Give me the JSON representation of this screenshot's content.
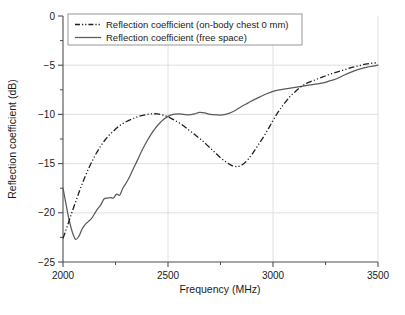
{
  "chart_data": {
    "type": "line",
    "title": "",
    "xlabel": "Frequency (MHz)",
    "ylabel": "Reflection coefficient (dB)",
    "xlim": [
      2000,
      3500
    ],
    "ylim": [
      -25,
      0
    ],
    "xticks": [
      2000,
      2500,
      3000,
      3500
    ],
    "xtick_labels": [
      "2000",
      "2500",
      "3000",
      "3500"
    ],
    "yticks": [
      0,
      -5,
      -10,
      -15,
      -20,
      -25
    ],
    "ytick_labels": [
      "0",
      "−5",
      "−10",
      "−15",
      "−20",
      "−25"
    ],
    "y_minor_ticks": [
      -2.5,
      -7.5,
      -12.5,
      -17.5,
      -22.5
    ],
    "x_minor_ticks": [
      2250,
      2750,
      3250
    ],
    "grid": true,
    "grid_axes": "both",
    "legend_position": "top-left-inside",
    "series": [
      {
        "name": "Reflection coefficient (on-body chest 0 mm)",
        "style": "dash-dot",
        "color": "#1f1f1f",
        "points": [
          [
            2000,
            -22.6
          ],
          [
            2020,
            -21.4
          ],
          [
            2040,
            -20.1
          ],
          [
            2060,
            -18.9
          ],
          [
            2080,
            -17.7
          ],
          [
            2100,
            -16.6
          ],
          [
            2120,
            -15.6
          ],
          [
            2140,
            -14.7
          ],
          [
            2160,
            -13.9
          ],
          [
            2180,
            -13.2
          ],
          [
            2200,
            -12.6
          ],
          [
            2220,
            -12.1
          ],
          [
            2240,
            -11.7
          ],
          [
            2260,
            -11.3
          ],
          [
            2280,
            -11.0
          ],
          [
            2300,
            -10.75
          ],
          [
            2330,
            -10.45
          ],
          [
            2360,
            -10.2
          ],
          [
            2390,
            -10.05
          ],
          [
            2420,
            -9.95
          ],
          [
            2450,
            -9.95
          ],
          [
            2480,
            -10.1
          ],
          [
            2510,
            -10.35
          ],
          [
            2540,
            -10.7
          ],
          [
            2570,
            -11.1
          ],
          [
            2600,
            -11.6
          ],
          [
            2630,
            -12.1
          ],
          [
            2660,
            -12.6
          ],
          [
            2690,
            -13.2
          ],
          [
            2720,
            -13.8
          ],
          [
            2750,
            -14.4
          ],
          [
            2780,
            -14.9
          ],
          [
            2805,
            -15.2
          ],
          [
            2830,
            -15.3
          ],
          [
            2855,
            -15.1
          ],
          [
            2880,
            -14.6
          ],
          [
            2905,
            -13.9
          ],
          [
            2930,
            -13.1
          ],
          [
            2960,
            -12.1
          ],
          [
            2990,
            -11.0
          ],
          [
            3020,
            -9.9
          ],
          [
            3050,
            -9.0
          ],
          [
            3080,
            -8.2
          ],
          [
            3110,
            -7.6
          ],
          [
            3140,
            -7.1
          ],
          [
            3170,
            -6.75
          ],
          [
            3200,
            -6.5
          ],
          [
            3230,
            -6.25
          ],
          [
            3260,
            -6.0
          ],
          [
            3290,
            -5.8
          ],
          [
            3320,
            -5.6
          ],
          [
            3350,
            -5.4
          ],
          [
            3380,
            -5.2
          ],
          [
            3410,
            -5.05
          ],
          [
            3440,
            -4.9
          ],
          [
            3470,
            -4.8
          ],
          [
            3500,
            -4.75
          ]
        ]
      },
      {
        "name": "Reflection coefficient (free space)",
        "style": "solid",
        "color": "#5a5a5a",
        "points": [
          [
            2000,
            -17.5
          ],
          [
            2015,
            -19.2
          ],
          [
            2030,
            -20.8
          ],
          [
            2045,
            -22.0
          ],
          [
            2060,
            -22.7
          ],
          [
            2075,
            -22.4
          ],
          [
            2090,
            -21.7
          ],
          [
            2105,
            -21.2
          ],
          [
            2120,
            -20.9
          ],
          [
            2135,
            -20.6
          ],
          [
            2150,
            -20.1
          ],
          [
            2165,
            -19.6
          ],
          [
            2180,
            -19.2
          ],
          [
            2195,
            -18.6
          ],
          [
            2210,
            -18.5
          ],
          [
            2225,
            -18.45
          ],
          [
            2240,
            -18.5
          ],
          [
            2255,
            -18.1
          ],
          [
            2270,
            -18.2
          ],
          [
            2285,
            -17.5
          ],
          [
            2300,
            -17.0
          ],
          [
            2320,
            -16.2
          ],
          [
            2340,
            -15.3
          ],
          [
            2360,
            -14.4
          ],
          [
            2380,
            -13.5
          ],
          [
            2400,
            -12.7
          ],
          [
            2420,
            -12.0
          ],
          [
            2440,
            -11.4
          ],
          [
            2460,
            -10.9
          ],
          [
            2480,
            -10.5
          ],
          [
            2500,
            -10.2
          ],
          [
            2525,
            -10.0
          ],
          [
            2550,
            -9.95
          ],
          [
            2575,
            -10.0
          ],
          [
            2600,
            -10.05
          ],
          [
            2625,
            -9.95
          ],
          [
            2650,
            -9.8
          ],
          [
            2675,
            -9.85
          ],
          [
            2700,
            -10.0
          ],
          [
            2730,
            -10.05
          ],
          [
            2760,
            -10.05
          ],
          [
            2790,
            -9.9
          ],
          [
            2820,
            -9.6
          ],
          [
            2850,
            -9.2
          ],
          [
            2880,
            -8.85
          ],
          [
            2910,
            -8.5
          ],
          [
            2940,
            -8.2
          ],
          [
            2970,
            -7.9
          ],
          [
            3000,
            -7.65
          ],
          [
            3030,
            -7.5
          ],
          [
            3060,
            -7.4
          ],
          [
            3090,
            -7.3
          ],
          [
            3120,
            -7.2
          ],
          [
            3150,
            -7.1
          ],
          [
            3180,
            -7.0
          ],
          [
            3210,
            -6.9
          ],
          [
            3240,
            -6.8
          ],
          [
            3270,
            -6.6
          ],
          [
            3300,
            -6.4
          ],
          [
            3330,
            -6.1
          ],
          [
            3360,
            -5.8
          ],
          [
            3390,
            -5.55
          ],
          [
            3420,
            -5.35
          ],
          [
            3450,
            -5.2
          ],
          [
            3475,
            -5.1
          ],
          [
            3500,
            -5.0
          ]
        ]
      }
    ],
    "legend_entries": [
      "Reflection coefficient (on-body chest 0 mm)",
      "Reflection coefficient (free space)"
    ]
  }
}
